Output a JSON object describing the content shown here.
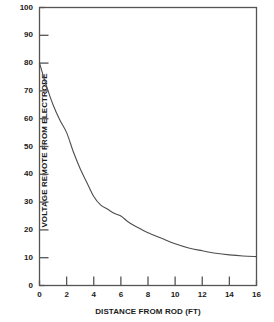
{
  "chart_data": {
    "type": "line",
    "title": "",
    "xlabel": "DISTANCE FROM ROD (FT)",
    "ylabel": "VOLTAGE REMOTE FROM ELECTRODE",
    "xlim": [
      0,
      16
    ],
    "ylim": [
      0,
      100
    ],
    "xticks": [
      0,
      2,
      4,
      6,
      8,
      10,
      12,
      14,
      16
    ],
    "yticks": [
      0,
      10,
      20,
      30,
      40,
      50,
      60,
      70,
      80,
      90,
      100
    ],
    "xtick_labels": [
      "0",
      "2",
      "4",
      "6",
      "8",
      "10",
      "12",
      "14",
      "16"
    ],
    "ytick_labels": [
      "0",
      "10",
      "20",
      "30",
      "40",
      "50",
      "60",
      "70",
      "80",
      "90",
      "100"
    ],
    "grid": false,
    "legend": null,
    "series": [
      {
        "name": "Voltage remote from electrode",
        "color": "#4d4d4d",
        "x": [
          0,
          0.5,
          1,
          1.5,
          2,
          2.5,
          3,
          3.5,
          4,
          4.5,
          5,
          5.5,
          6,
          6.5,
          7,
          7.5,
          8,
          9,
          10,
          11,
          12,
          13,
          14,
          15,
          16
        ],
        "values": [
          80,
          72,
          65,
          59.5,
          55,
          48,
          42,
          37,
          32,
          29,
          27.5,
          26,
          25,
          23,
          21.5,
          20.2,
          19,
          17,
          15,
          13.5,
          12.5,
          11.6,
          11,
          10.6,
          10.4
        ]
      }
    ]
  },
  "axes": {
    "frame_color": "#555555",
    "tick_color": "#555555",
    "text_color": "#1a1a1a"
  }
}
